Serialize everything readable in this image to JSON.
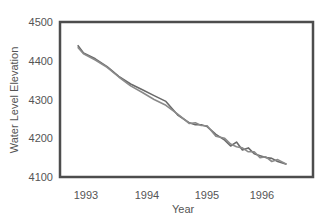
{
  "chart_data": {
    "type": "line",
    "title": "",
    "xlabel": "Year",
    "ylabel": "Water Level Elevation",
    "ylim": [
      4100,
      4500
    ],
    "xlim": [
      1992.6,
      1996.9
    ],
    "grid": false,
    "legend": null,
    "x_ticks": [
      "1993",
      "1994",
      "1995",
      "1996"
    ],
    "y_ticks": [
      "4500",
      "4400",
      "4300",
      "4200",
      "4100"
    ],
    "series": [
      {
        "name": "Series A",
        "color": "#6a6a6a",
        "x": [
          1992.9,
          1993.0,
          1993.2,
          1993.4,
          1993.6,
          1993.8,
          1994.0,
          1994.2,
          1994.4,
          1994.6,
          1994.8,
          1994.9,
          1995.0,
          1995.1,
          1995.25,
          1995.4,
          1995.5,
          1995.6,
          1995.7,
          1995.8,
          1995.9,
          1996.0,
          1996.1,
          1996.2,
          1996.3,
          1996.45
        ],
        "y": [
          4440,
          4420,
          4405,
          4385,
          4360,
          4340,
          4325,
          4310,
          4295,
          4260,
          4240,
          4235,
          4235,
          4230,
          4210,
          4195,
          4180,
          4190,
          4170,
          4175,
          4160,
          4155,
          4150,
          4148,
          4140,
          4133
        ]
      },
      {
        "name": "Series B",
        "color": "#8a8a8a",
        "x": [
          1992.9,
          1993.0,
          1993.2,
          1993.4,
          1993.6,
          1993.8,
          1994.0,
          1994.2,
          1994.4,
          1994.6,
          1994.8,
          1994.9,
          1995.0,
          1995.1,
          1995.25,
          1995.4,
          1995.5,
          1995.6,
          1995.7,
          1995.8,
          1995.9,
          1996.0,
          1996.1,
          1996.2,
          1996.3,
          1996.45
        ],
        "y": [
          4435,
          4418,
          4402,
          4383,
          4358,
          4335,
          4318,
          4300,
          4285,
          4262,
          4238,
          4240,
          4233,
          4232,
          4205,
          4200,
          4185,
          4178,
          4175,
          4165,
          4165,
          4150,
          4152,
          4140,
          4145,
          4133
        ]
      }
    ]
  }
}
